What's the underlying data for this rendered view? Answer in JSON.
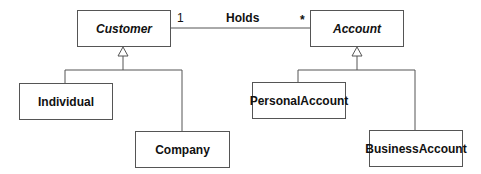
{
  "diagram": {
    "type": "UML class diagram",
    "classes": [
      {
        "id": "customer",
        "name": "Customer",
        "abstract": true
      },
      {
        "id": "account",
        "name": "Account",
        "abstract": true
      },
      {
        "id": "individual",
        "name": "Individual",
        "abstract": false
      },
      {
        "id": "company",
        "name": "Company",
        "abstract": false
      },
      {
        "id": "personal_account",
        "name": "PersonalAccount",
        "abstract": false
      },
      {
        "id": "business_account",
        "name": "BusinessAccount",
        "abstract": false
      }
    ],
    "association": {
      "name": "Holds",
      "from": "Customer",
      "to": "Account",
      "from_multiplicity": "1",
      "to_multiplicity": "*"
    },
    "generalizations": [
      {
        "parent": "Customer",
        "children": [
          "Individual",
          "Company"
        ]
      },
      {
        "parent": "Account",
        "children": [
          "PersonalAccount",
          "BusinessAccount"
        ]
      }
    ],
    "colors": {
      "line": "#555555",
      "text": "#111111",
      "background": "#ffffff"
    }
  }
}
